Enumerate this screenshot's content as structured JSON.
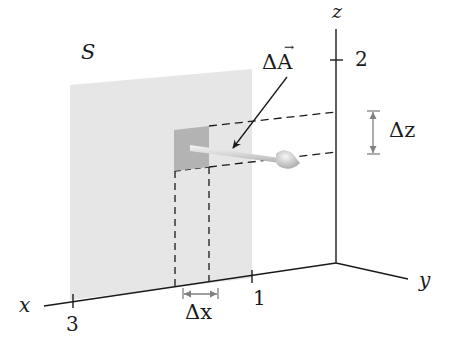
{
  "figure": {
    "surface_label": "S",
    "area_vector_label": "ΔA",
    "area_vector_arrow_accent": "→",
    "delta_z_label": "Δz",
    "delta_x_label": "Δx",
    "axes": {
      "x_label": "x",
      "y_label": "y",
      "z_label": "z",
      "x_ticks": [
        "3",
        "1"
      ],
      "z_ticks": [
        "2"
      ]
    },
    "colors": {
      "surface": "#e6e6e6",
      "patch": "#b3b3b3",
      "axis": "#1a1a1a",
      "dimension_marker": "#808080",
      "vector": "#dcdcdc"
    }
  }
}
